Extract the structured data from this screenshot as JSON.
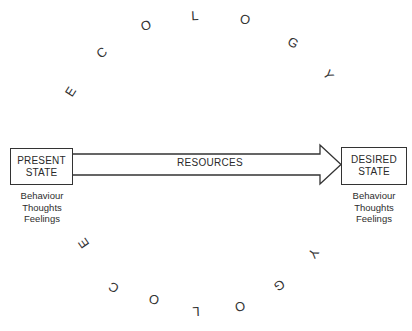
{
  "colors": {
    "ink": "#333333",
    "background": "#ffffff"
  },
  "ecology_top": {
    "word": "ECOLOGY",
    "letters": [
      {
        "char": "E",
        "x": 71,
        "y": 92,
        "rotate": -58
      },
      {
        "char": "C",
        "x": 102,
        "y": 53,
        "rotate": -38
      },
      {
        "char": "O",
        "x": 146,
        "y": 26,
        "rotate": -18
      },
      {
        "char": "L",
        "x": 195,
        "y": 16,
        "rotate": -3
      },
      {
        "char": "O",
        "x": 245,
        "y": 20,
        "rotate": 12
      },
      {
        "char": "G",
        "x": 293,
        "y": 43,
        "rotate": 30
      },
      {
        "char": "Y",
        "x": 328,
        "y": 75,
        "rotate": 55
      }
    ]
  },
  "ecology_bottom": {
    "word": "ECOLOGY",
    "letters": [
      {
        "char": "E",
        "x": 84,
        "y": 243,
        "rotate": -125
      },
      {
        "char": "C",
        "x": 114,
        "y": 287,
        "rotate": -150
      },
      {
        "char": "O",
        "x": 154,
        "y": 299,
        "rotate": -170
      },
      {
        "char": "L",
        "x": 196,
        "y": 311,
        "rotate": 178
      },
      {
        "char": "O",
        "x": 240,
        "y": 306,
        "rotate": 170
      },
      {
        "char": "G",
        "x": 279,
        "y": 285,
        "rotate": 150
      },
      {
        "char": "Y",
        "x": 313,
        "y": 253,
        "rotate": 125
      }
    ]
  },
  "present_state": {
    "line1": "PRESENT",
    "line2": "STATE",
    "attributes": [
      "Behaviour",
      "Thoughts",
      "Feelings"
    ]
  },
  "arrow": {
    "label": "RESOURCES"
  },
  "desired_state": {
    "line1": "DESIRED",
    "line2": "STATE",
    "attributes": [
      "Behaviour",
      "Thoughts",
      "Feelings"
    ]
  }
}
